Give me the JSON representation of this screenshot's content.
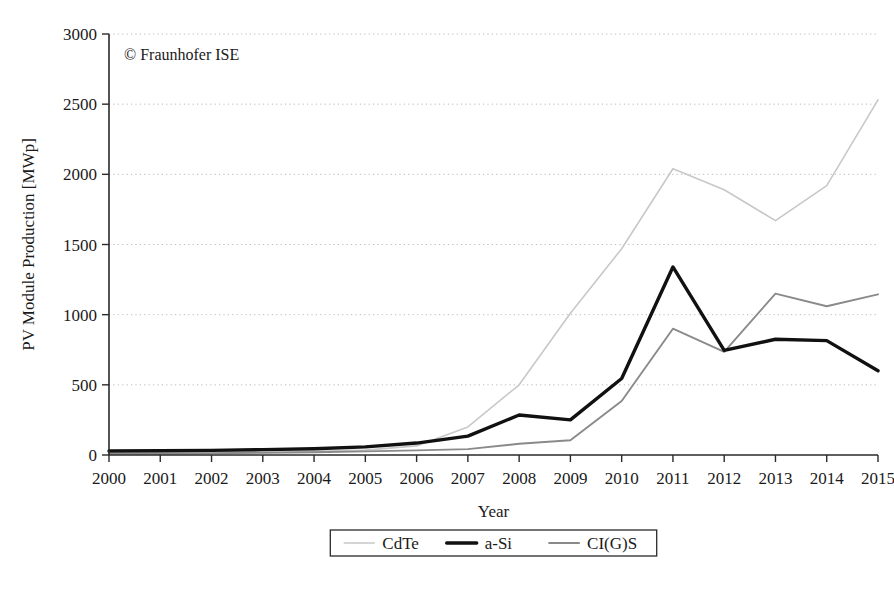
{
  "credit": "© Fraunhofer ISE",
  "legend": {
    "position": "bottom-center",
    "entries": [
      {
        "label": "CdTe",
        "color": "#c8c8c8",
        "width": 1.6
      },
      {
        "label": "a-Si",
        "color": "#111111",
        "width": 3.4
      },
      {
        "label": "CI(G)S",
        "color": "#8a8a8a",
        "width": 1.9
      }
    ]
  },
  "chart_data": {
    "type": "line",
    "title": "",
    "subtitle": "",
    "xlabel": "Year",
    "ylabel": "PV Module Production [MWp]",
    "x": [
      2000,
      2001,
      2002,
      2003,
      2004,
      2005,
      2006,
      2007,
      2008,
      2009,
      2010,
      2011,
      2012,
      2013,
      2014,
      2015
    ],
    "categories": [
      "2000",
      "2001",
      "2002",
      "2003",
      "2004",
      "2005",
      "2006",
      "2007",
      "2008",
      "2009",
      "2010",
      "2011",
      "2012",
      "2013",
      "2014",
      "2015"
    ],
    "xlim": [
      2000,
      2015
    ],
    "ylim": [
      0,
      3000
    ],
    "yticks": [
      0,
      500,
      1000,
      1500,
      2000,
      2500,
      3000
    ],
    "ytick_labels": [
      "0",
      "500",
      "1000",
      "1500",
      "2000",
      "2500",
      "3000"
    ],
    "xticks": [
      2000,
      2001,
      2002,
      2003,
      2004,
      2005,
      2006,
      2007,
      2008,
      2009,
      2010,
      2011,
      2012,
      2013,
      2014,
      2015
    ],
    "grid": "horizontal-dotted",
    "annotations": [
      "© Fraunhofer ISE"
    ],
    "series": [
      {
        "name": "CdTe",
        "color": "#c8c8c8",
        "stroke_width": 1.6,
        "values": [
          5,
          8,
          12,
          18,
          26,
          35,
          65,
          200,
          500,
          1010,
          1470,
          2040,
          1890,
          1670,
          1920,
          2530
        ]
      },
      {
        "name": "a-Si",
        "color": "#111111",
        "stroke_width": 3.4,
        "values": [
          28,
          30,
          33,
          38,
          45,
          58,
          85,
          135,
          285,
          250,
          545,
          1340,
          745,
          825,
          815,
          600
        ]
      },
      {
        "name": "CI(G)S",
        "color": "#8a8a8a",
        "stroke_width": 1.9,
        "values": [
          10,
          11,
          13,
          16,
          20,
          26,
          33,
          42,
          80,
          105,
          385,
          900,
          735,
          1150,
          1060,
          1145
        ]
      }
    ]
  },
  "plot_geometry": {
    "left": 109,
    "right": 878,
    "top": 34,
    "bottom": 455
  }
}
